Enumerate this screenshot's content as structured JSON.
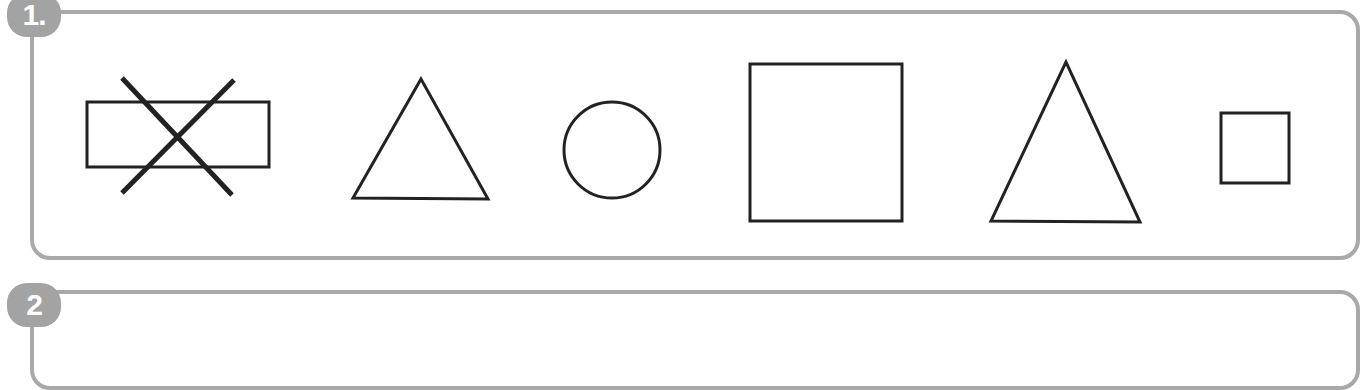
{
  "exercises": [
    {
      "number_label": "1.",
      "shapes": [
        {
          "type": "rectangle",
          "crossed_out": true,
          "x": 87,
          "y": 102,
          "w": 182,
          "h": 65
        },
        {
          "type": "triangle",
          "points": "421,79 353,198 488,199"
        },
        {
          "type": "circle",
          "cx": 612,
          "cy": 150,
          "r": 48
        },
        {
          "type": "square",
          "x": 750,
          "y": 64,
          "w": 152,
          "h": 157
        },
        {
          "type": "triangle",
          "points": "1066,62 991,221 1140,222"
        },
        {
          "type": "square",
          "x": 1221,
          "y": 113,
          "w": 68,
          "h": 70
        }
      ]
    },
    {
      "number_label": "2",
      "shapes": []
    }
  ],
  "colors": {
    "frame": "#a9a9a9",
    "badge": "#a3a3a3",
    "stroke": "#222222"
  }
}
